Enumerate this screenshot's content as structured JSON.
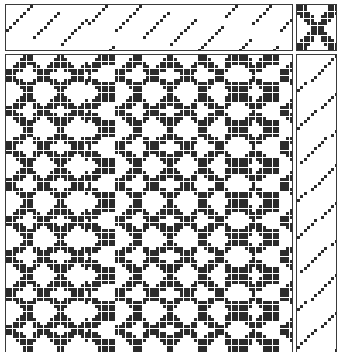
{
  "document": {
    "kind": "weaving-draft",
    "title": "Weaving draft drawdown",
    "colors": {
      "ink": "#2b2b2b",
      "ground": "#ffffff",
      "grid_line": "#3a3a3a"
    }
  },
  "panels": {
    "threading": {
      "name": "Threading",
      "shafts": 14,
      "warp_ends": 84,
      "cell_px": 3.42,
      "origin": {
        "x": 6,
        "y": 5
      },
      "size": {
        "width": 287,
        "height": 46
      },
      "description": "Advancing point-twill threading; short rising diagonal runs of 8 ends that step across the warp.",
      "run_length": 8,
      "shaft_sequence": [
        7,
        8,
        9,
        10,
        11,
        12,
        13,
        14,
        5,
        6,
        7,
        8,
        9,
        10,
        11,
        12,
        3,
        4,
        5,
        6,
        7,
        8,
        9,
        10,
        9,
        10,
        11,
        12,
        13,
        14,
        1,
        2,
        7,
        8,
        9,
        10,
        11,
        12,
        13,
        14,
        5,
        6,
        7,
        8,
        9,
        10,
        11,
        12,
        3,
        4,
        5,
        6,
        7,
        8,
        9,
        10,
        1,
        2,
        3,
        4,
        5,
        6,
        7,
        8,
        11,
        12,
        13,
        14,
        1,
        2,
        3,
        4,
        9,
        10,
        11,
        12,
        13,
        14,
        1,
        2,
        7,
        8,
        9,
        10
      ]
    },
    "tieup": {
      "name": "Tie-up",
      "rows": 14,
      "cols": 12,
      "cell_px": 3.42,
      "origin": {
        "x": 297,
        "y": 5
      },
      "size": {
        "width": 40,
        "height": 46
      },
      "description": "Symmetric X / saltire tie-up: two heavy crossing diagonals with filled quadrant corners, typical of an 8-shaft twill-derived network draft."
    },
    "drawdown": {
      "name": "Drawdown",
      "warp_ends": 84,
      "picks": 87,
      "cell_px": 3.42,
      "origin": {
        "x": 6,
        "y": 55
      },
      "size": {
        "width": 287,
        "height": 297
      },
      "description": "Dense black-and-white interlacement: diagonal twill lines breaking into blocks, arrowheads and chevrons forming a large-scale lattice of solid and speckled squares."
    },
    "treadling": {
      "name": "Treadling",
      "treadles": 12,
      "picks": 87,
      "cell_px": 3.42,
      "origin": {
        "x": 297,
        "y": 55
      },
      "size": {
        "width": 40,
        "height": 297
      },
      "description": "Descending dotted diagonals of 8 picks each, repeating down the column and mirroring the threading."
    }
  },
  "legend": {
    "filled_cell": "warp raised (black square)",
    "empty_cell": "weft showing (white square)"
  }
}
